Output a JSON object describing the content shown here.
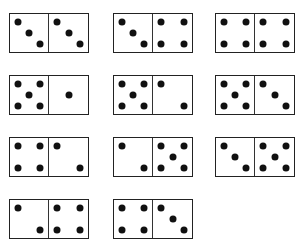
{
  "pip_color": "#111111",
  "border_color": "#222222",
  "dominoes": [
    {
      "left": 3,
      "right": 3,
      "x": 9,
      "y": 13
    },
    {
      "left": 3,
      "right": 4,
      "x": 113,
      "y": 13
    },
    {
      "left": 4,
      "right": 4,
      "x": 215,
      "y": 13
    },
    {
      "left": 5,
      "right": 1,
      "x": 9,
      "y": 75
    },
    {
      "left": 5,
      "right": 2,
      "x": 113,
      "y": 75
    },
    {
      "left": 5,
      "right": 3,
      "x": 215,
      "y": 75
    },
    {
      "left": 4,
      "right": 2,
      "x": 9,
      "y": 137
    },
    {
      "left": 2,
      "right": 5,
      "x": 113,
      "y": 137
    },
    {
      "left": 3,
      "right": 5,
      "x": 215,
      "y": 137
    },
    {
      "left": 2,
      "right": 4,
      "x": 9,
      "y": 199
    },
    {
      "left": 4,
      "right": 3,
      "x": 113,
      "y": 199
    }
  ]
}
